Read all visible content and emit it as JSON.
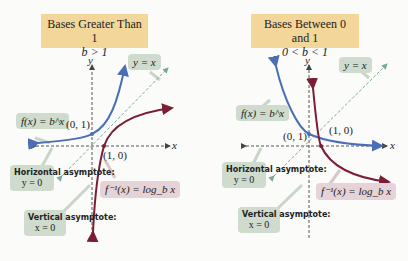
{
  "panels": [
    {
      "title": "Bases Greater Than 1",
      "condition": "b > 1",
      "labels": {
        "y_axis": "y",
        "x_axis": "x",
        "identity_line": "y = x",
        "exp_function": "f(x) = b^x",
        "log_function": "f⁻¹(x) = log_b x",
        "point_exp": "(0, 1)",
        "point_log": "(1, 0)",
        "horizontal_asymptote_title": "Horizontal asymptote:",
        "horizontal_asymptote_eq": "y = 0",
        "vertical_asymptote_title": "Vertical asymptote:",
        "vertical_asymptote_eq": "x = 0"
      }
    },
    {
      "title": "Bases Between 0 and 1",
      "condition": "0 < b < 1",
      "labels": {
        "y_axis": "y",
        "x_axis": "x",
        "identity_line": "y = x",
        "exp_function": "f(x) = b^x",
        "log_function": "f⁻¹(x) = log_b x",
        "point_exp": "(0, 1)",
        "point_log": "(1, 0)",
        "horizontal_asymptote_title": "Horizontal asymptote:",
        "horizontal_asymptote_eq": "y = 0",
        "vertical_asymptote_title": "Vertical asymptote:",
        "vertical_asymptote_eq": "x = 0"
      }
    }
  ],
  "colors": {
    "exp_curve": "#4a6fb5",
    "log_curve": "#7a1d35",
    "identity_line": "#7aa89a",
    "title_bg": "#f2d69a",
    "tag_green": "#cfdccd",
    "tag_pink": "#e6d3d8"
  }
}
